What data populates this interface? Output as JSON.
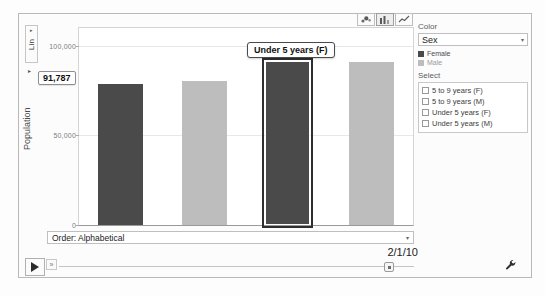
{
  "axis_scale_button": {
    "label": "Lin",
    "caret": "▸"
  },
  "axis_expand_caret": "▸",
  "chart_type_buttons": [
    {
      "name": "bubble-chart",
      "selected": false
    },
    {
      "name": "bar-chart",
      "selected": true
    },
    {
      "name": "line-chart",
      "selected": false
    }
  ],
  "tooltip": {
    "text": "Under 5 years (F)"
  },
  "value_callout": {
    "text": "91,787"
  },
  "side_panel": {
    "color_label": "Color",
    "color_select_value": "Sex",
    "caret": "▾",
    "legend": [
      {
        "label": "Female",
        "color": "#4a4a4a"
      },
      {
        "label": "Male",
        "color": "#bdbdbd"
      }
    ],
    "select_label": "Select",
    "checkboxes": [
      {
        "label": "5 to 9 years (F)",
        "checked": false
      },
      {
        "label": "5 to 9 years (M)",
        "checked": false
      },
      {
        "label": "Under 5 years (F)",
        "checked": false
      },
      {
        "label": "Under 5 years (M)",
        "checked": false
      }
    ]
  },
  "order_dropdown": {
    "value": "Order: Alphabetical",
    "caret": "▾"
  },
  "date_readout": {
    "value": "2/1/10"
  },
  "playback": {
    "play_label": "▶",
    "speed_label": "»",
    "timeline_position_pct": 93
  },
  "chart_data": {
    "type": "bar",
    "title": "",
    "xlabel": "",
    "ylabel": "Population",
    "ylim": [
      0,
      110000
    ],
    "grid": true,
    "legend_position": "right",
    "ytick_labels": [
      "100,000",
      "50,000",
      "0"
    ],
    "ytick_values": [
      100000,
      50000,
      0
    ],
    "categories": [
      "5 to 9 years (F)",
      "5 to 9 years (M)",
      "Under 5 years (F)",
      "Under 5 years (M)"
    ],
    "values": [
      79000,
      80500,
      91787,
      91000
    ],
    "colors": [
      "#4a4a4a",
      "#bdbdbd",
      "#4a4a4a",
      "#bdbdbd"
    ],
    "selected_index": 2,
    "series": [
      {
        "name": "Female",
        "color": "#4a4a4a"
      },
      {
        "name": "Male",
        "color": "#bdbdbd"
      }
    ]
  }
}
